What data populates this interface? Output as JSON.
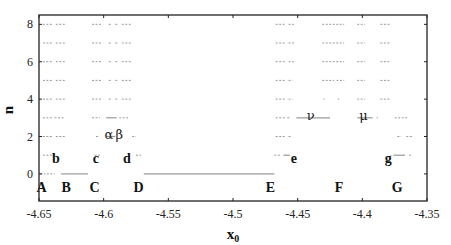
{
  "chart_data": {
    "type": "scatter",
    "title": "",
    "xlabel": "x0",
    "xlabel_main": "x",
    "xlabel_sub": "0",
    "ylabel": "n",
    "xlim": [
      -4.65,
      -4.35
    ],
    "ylim": [
      -1.45,
      8.5
    ],
    "grid": false,
    "legend": null,
    "x_ticks": [
      -4.65,
      -4.6,
      -4.55,
      -4.5,
      -4.45,
      -4.4,
      -4.35
    ],
    "x_tick_labels": [
      "-4.65",
      "-4.6",
      "-4.55",
      "-4.5",
      "-4.45",
      "-4.4",
      "-4.35"
    ],
    "y_ticks": [
      0,
      2,
      4,
      6,
      8
    ],
    "y_tick_labels": [
      "0",
      "2",
      "4",
      "6",
      "8"
    ],
    "segments": [
      {
        "n": 0,
        "x_start": -4.649,
        "x_end": -4.645,
        "style": "dotted"
      },
      {
        "n": 0,
        "x_start": -4.644,
        "x_end": -4.638,
        "style": "dotted"
      },
      {
        "n": 0,
        "x_start": -4.633,
        "x_end": -4.612,
        "style": "solid"
      },
      {
        "n": 0,
        "x_start": -4.569,
        "x_end": -4.468,
        "style": "solid"
      },
      {
        "n": 1,
        "x_start": -4.647,
        "x_end": -4.64,
        "style": "dotted"
      },
      {
        "n": 1,
        "x_start": -4.639,
        "x_end": -4.636,
        "style": "dotted"
      },
      {
        "n": 1,
        "x_start": -4.607,
        "x_end": -4.603,
        "style": "dotted"
      },
      {
        "n": 1,
        "x_start": -4.575,
        "x_end": -4.571,
        "style": "dotted"
      },
      {
        "n": 1,
        "x_start": -4.468,
        "x_end": -4.463,
        "style": "dotted"
      },
      {
        "n": 1,
        "x_start": -4.461,
        "x_end": -4.456,
        "style": "solid"
      },
      {
        "n": 1,
        "x_start": -4.376,
        "x_end": -4.367,
        "style": "solid"
      },
      {
        "n": 1,
        "x_start": -4.364,
        "x_end": -4.362,
        "style": "dotted"
      },
      {
        "n": 2,
        "x_start": -4.647,
        "x_end": -4.64,
        "style": "dotted"
      },
      {
        "n": 2,
        "x_start": -4.637,
        "x_end": -4.63,
        "style": "dotted"
      },
      {
        "n": 2,
        "x_start": -4.606,
        "x_end": -4.604,
        "style": "dotted"
      },
      {
        "n": 2,
        "x_start": -4.598,
        "x_end": -4.591,
        "style": "solid"
      },
      {
        "n": 2,
        "x_start": -4.578,
        "x_end": -4.575,
        "style": "dotted"
      },
      {
        "n": 2,
        "x_start": -4.467,
        "x_end": -4.46,
        "style": "dotted"
      },
      {
        "n": 2,
        "x_start": -4.457,
        "x_end": -4.455,
        "style": "dotted"
      },
      {
        "n": 2,
        "x_start": -4.373,
        "x_end": -4.37,
        "style": "dotted"
      },
      {
        "n": 2,
        "x_start": -4.366,
        "x_end": -4.361,
        "style": "dotted"
      },
      {
        "n": 3,
        "x_start": -4.647,
        "x_end": -4.64,
        "style": "dotted"
      },
      {
        "n": 3,
        "x_start": -4.638,
        "x_end": -4.63,
        "style": "dotted"
      },
      {
        "n": 3,
        "x_start": -4.609,
        "x_end": -4.603,
        "style": "dotted"
      },
      {
        "n": 3,
        "x_start": -4.598,
        "x_end": -4.59,
        "style": "solid"
      },
      {
        "n": 3,
        "x_start": -4.588,
        "x_end": -4.58,
        "style": "dotted"
      },
      {
        "n": 3,
        "x_start": -4.467,
        "x_end": -4.46,
        "style": "dotted"
      },
      {
        "n": 3,
        "x_start": -4.458,
        "x_end": -4.456,
        "style": "dotted"
      },
      {
        "n": 3,
        "x_start": -4.451,
        "x_end": -4.425,
        "style": "solid"
      },
      {
        "n": 3,
        "x_start": -4.404,
        "x_end": -4.392,
        "style": "solid"
      },
      {
        "n": 3,
        "x_start": -4.389,
        "x_end": -4.388,
        "style": "dotted"
      },
      {
        "n": 3,
        "x_start": -4.375,
        "x_end": -4.365,
        "style": "dotted"
      },
      {
        "n": 4,
        "x_start": -4.647,
        "x_end": -4.64,
        "style": "dotted"
      },
      {
        "n": 4,
        "x_start": -4.637,
        "x_end": -4.63,
        "style": "dotted"
      },
      {
        "n": 4,
        "x_start": -4.609,
        "x_end": -4.602,
        "style": "dotted"
      },
      {
        "n": 4,
        "x_start": -4.596,
        "x_end": -4.594,
        "style": "dotted"
      },
      {
        "n": 4,
        "x_start": -4.591,
        "x_end": -4.589,
        "style": "dotted"
      },
      {
        "n": 4,
        "x_start": -4.586,
        "x_end": -4.579,
        "style": "dotted"
      },
      {
        "n": 4,
        "x_start": -4.467,
        "x_end": -4.46,
        "style": "dotted"
      },
      {
        "n": 4,
        "x_start": -4.457,
        "x_end": -4.454,
        "style": "dotted"
      },
      {
        "n": 4,
        "x_start": -4.43,
        "x_end": -4.429,
        "style": "dotted"
      },
      {
        "n": 4,
        "x_start": -4.419,
        "x_end": -4.418,
        "style": "dotted"
      },
      {
        "n": 4,
        "x_start": -4.404,
        "x_end": -4.398,
        "style": "dotted"
      },
      {
        "n": 4,
        "x_start": -4.386,
        "x_end": -4.379,
        "style": "dotted"
      },
      {
        "n": 5,
        "x_start": -4.647,
        "x_end": -4.64,
        "style": "dotted"
      },
      {
        "n": 5,
        "x_start": -4.637,
        "x_end": -4.63,
        "style": "dotted"
      },
      {
        "n": 5,
        "x_start": -4.609,
        "x_end": -4.602,
        "style": "dotted"
      },
      {
        "n": 5,
        "x_start": -4.596,
        "x_end": -4.594,
        "style": "dotted"
      },
      {
        "n": 5,
        "x_start": -4.591,
        "x_end": -4.589,
        "style": "dotted"
      },
      {
        "n": 5,
        "x_start": -4.586,
        "x_end": -4.579,
        "style": "dotted"
      },
      {
        "n": 5,
        "x_start": -4.467,
        "x_end": -4.46,
        "style": "dotted"
      },
      {
        "n": 5,
        "x_start": -4.457,
        "x_end": -4.454,
        "style": "dotted"
      },
      {
        "n": 5,
        "x_start": -4.431,
        "x_end": -4.422,
        "style": "dotted"
      },
      {
        "n": 5,
        "x_start": -4.42,
        "x_end": -4.414,
        "style": "dotted"
      },
      {
        "n": 5,
        "x_start": -4.404,
        "x_end": -4.398,
        "style": "dotted"
      },
      {
        "n": 5,
        "x_start": -4.386,
        "x_end": -4.379,
        "style": "dotted"
      },
      {
        "n": 6,
        "x_start": -4.647,
        "x_end": -4.64,
        "style": "dotted"
      },
      {
        "n": 6,
        "x_start": -4.637,
        "x_end": -4.63,
        "style": "dotted"
      },
      {
        "n": 6,
        "x_start": -4.609,
        "x_end": -4.602,
        "style": "dotted"
      },
      {
        "n": 6,
        "x_start": -4.596,
        "x_end": -4.594,
        "style": "dotted"
      },
      {
        "n": 6,
        "x_start": -4.591,
        "x_end": -4.589,
        "style": "dotted"
      },
      {
        "n": 6,
        "x_start": -4.586,
        "x_end": -4.579,
        "style": "dotted"
      },
      {
        "n": 6,
        "x_start": -4.467,
        "x_end": -4.46,
        "style": "dotted"
      },
      {
        "n": 6,
        "x_start": -4.457,
        "x_end": -4.453,
        "style": "dotted"
      },
      {
        "n": 6,
        "x_start": -4.431,
        "x_end": -4.414,
        "style": "dotted"
      },
      {
        "n": 6,
        "x_start": -4.404,
        "x_end": -4.398,
        "style": "dotted"
      },
      {
        "n": 6,
        "x_start": -4.386,
        "x_end": -4.379,
        "style": "dotted"
      },
      {
        "n": 7,
        "x_start": -4.647,
        "x_end": -4.64,
        "style": "dotted"
      },
      {
        "n": 7,
        "x_start": -4.637,
        "x_end": -4.63,
        "style": "dotted"
      },
      {
        "n": 7,
        "x_start": -4.609,
        "x_end": -4.602,
        "style": "dotted"
      },
      {
        "n": 7,
        "x_start": -4.596,
        "x_end": -4.594,
        "style": "dotted"
      },
      {
        "n": 7,
        "x_start": -4.591,
        "x_end": -4.589,
        "style": "dotted"
      },
      {
        "n": 7,
        "x_start": -4.586,
        "x_end": -4.579,
        "style": "dotted"
      },
      {
        "n": 7,
        "x_start": -4.467,
        "x_end": -4.46,
        "style": "dotted"
      },
      {
        "n": 7,
        "x_start": -4.457,
        "x_end": -4.452,
        "style": "dotted"
      },
      {
        "n": 7,
        "x_start": -4.431,
        "x_end": -4.414,
        "style": "dotted"
      },
      {
        "n": 7,
        "x_start": -4.404,
        "x_end": -4.398,
        "style": "dotted"
      },
      {
        "n": 7,
        "x_start": -4.386,
        "x_end": -4.379,
        "style": "dotted"
      },
      {
        "n": 8,
        "x_start": -4.647,
        "x_end": -4.64,
        "style": "dotted"
      },
      {
        "n": 8,
        "x_start": -4.637,
        "x_end": -4.63,
        "style": "dotted"
      },
      {
        "n": 8,
        "x_start": -4.609,
        "x_end": -4.602,
        "style": "dotted"
      },
      {
        "n": 8,
        "x_start": -4.596,
        "x_end": -4.594,
        "style": "dotted"
      },
      {
        "n": 8,
        "x_start": -4.591,
        "x_end": -4.589,
        "style": "dotted"
      },
      {
        "n": 8,
        "x_start": -4.586,
        "x_end": -4.579,
        "style": "dotted"
      },
      {
        "n": 8,
        "x_start": -4.467,
        "x_end": -4.46,
        "style": "dotted"
      },
      {
        "n": 8,
        "x_start": -4.457,
        "x_end": -4.452,
        "style": "dotted"
      },
      {
        "n": 8,
        "x_start": -4.431,
        "x_end": -4.414,
        "style": "dotted"
      },
      {
        "n": 8,
        "x_start": -4.404,
        "x_end": -4.398,
        "style": "dotted"
      },
      {
        "n": 8,
        "x_start": -4.386,
        "x_end": -4.379,
        "style": "dotted"
      }
    ],
    "annotations": [
      {
        "text": "A",
        "x": -4.648,
        "n": -0.7,
        "style": "bold"
      },
      {
        "text": "B",
        "x": -4.629,
        "n": -0.7,
        "style": "bold"
      },
      {
        "text": "C",
        "x": -4.607,
        "n": -0.7,
        "style": "bold"
      },
      {
        "text": "D",
        "x": -4.573,
        "n": -0.7,
        "style": "bold"
      },
      {
        "text": "E",
        "x": -4.471,
        "n": -0.7,
        "style": "bold"
      },
      {
        "text": "F",
        "x": -4.418,
        "n": -0.7,
        "style": "bold"
      },
      {
        "text": "G",
        "x": -4.373,
        "n": -0.7,
        "style": "bold"
      },
      {
        "text": "b",
        "x": -4.637,
        "n": 0.85,
        "style": "bold"
      },
      {
        "text": "c",
        "x": -4.606,
        "n": 0.85,
        "style": "bold"
      },
      {
        "text": "d",
        "x": -4.582,
        "n": 0.85,
        "style": "bold"
      },
      {
        "text": "e",
        "x": -4.453,
        "n": 0.85,
        "style": "bold"
      },
      {
        "text": "g",
        "x": -4.38,
        "n": 0.85,
        "style": "bold"
      },
      {
        "text": "α",
        "x": -4.596,
        "n": 2.15,
        "style": "greek"
      },
      {
        "text": "β",
        "x": -4.588,
        "n": 2.15,
        "style": "greek"
      },
      {
        "text": "ν",
        "x": -4.44,
        "n": 3.15,
        "style": "greek"
      },
      {
        "text": "μ",
        "x": -4.399,
        "n": 3.15,
        "style": "greek"
      }
    ]
  },
  "colors": {
    "axis": "#222222",
    "segment": "#9a9a9a",
    "text": "#111111",
    "background": "#ffffff"
  }
}
